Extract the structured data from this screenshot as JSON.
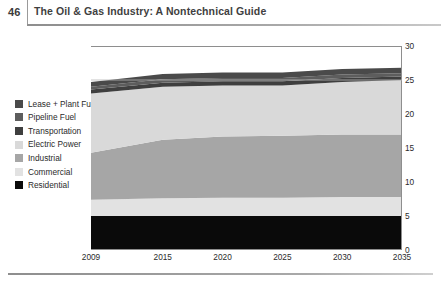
{
  "header": {
    "folio": "46",
    "running_title": "The Oil & Gas Industry: A Nontechnical Guide"
  },
  "legend": {
    "items": [
      {
        "label": "Lease + Plant Fuel",
        "color": "#4a4a4a"
      },
      {
        "label": "Pipeline Fuel",
        "color": "#5d5d5d"
      },
      {
        "label": "Transportation",
        "color": "#3f3f3f"
      },
      {
        "label": "Electric Power",
        "color": "#d9d9d9"
      },
      {
        "label": "Industrial",
        "color": "#a6a6a6"
      },
      {
        "label": "Commercial",
        "color": "#e2e2e2"
      },
      {
        "label": "Residential",
        "color": "#0a0a0a"
      }
    ]
  },
  "chart_data": {
    "type": "area",
    "stacked": true,
    "title": "",
    "subtitle": "",
    "xlabel": "",
    "ylabel": "",
    "x": [
      2009,
      2015,
      2020,
      2025,
      2030,
      2035
    ],
    "categories": [
      "2009",
      "2015",
      "2020",
      "2025",
      "2030",
      "2035"
    ],
    "xticklabels": [
      "2009",
      "2015",
      "2020",
      "2025",
      "2030",
      "2035"
    ],
    "xlim": [
      2009,
      2035
    ],
    "ylim": [
      0,
      30
    ],
    "yticks": [
      0,
      5,
      10,
      15,
      20,
      25,
      30
    ],
    "yticklabels": [
      "0",
      "5",
      "10",
      "15",
      "20",
      "25",
      "30"
    ],
    "y_axis_position": "right",
    "grid": false,
    "legend_position": "left-outside",
    "series": [
      {
        "name": "Residential",
        "color": "#0a0a0a",
        "values": [
          5.0,
          5.0,
          5.0,
          5.0,
          5.0,
          5.0
        ]
      },
      {
        "name": "Commercial",
        "color": "#e2e2e2",
        "values": [
          2.4,
          2.6,
          2.7,
          2.7,
          2.8,
          2.8
        ]
      },
      {
        "name": "Industrial",
        "color": "#a6a6a6",
        "values": [
          6.9,
          8.6,
          9.0,
          9.1,
          9.2,
          9.2
        ]
      },
      {
        "name": "Electric Power",
        "color": "#d9d9d9",
        "values": [
          8.7,
          7.8,
          7.5,
          7.4,
          7.7,
          8.0
        ]
      },
      {
        "name": "Transportation",
        "color": "#3f3f3f",
        "values": [
          0.6,
          0.6,
          0.6,
          0.6,
          0.6,
          0.5
        ]
      },
      {
        "name": "Pipeline Fuel",
        "color": "#5d5d5d",
        "values": [
          0.4,
          0.5,
          0.5,
          0.5,
          0.5,
          0.5
        ]
      },
      {
        "name": "Lease + Plant Fuel",
        "color": "#4a4a4a",
        "values": [
          0.7,
          0.8,
          0.8,
          0.8,
          0.8,
          0.8
        ]
      }
    ],
    "totals": [
      24.7,
      25.9,
      26.1,
      26.1,
      26.6,
      26.8
    ]
  }
}
